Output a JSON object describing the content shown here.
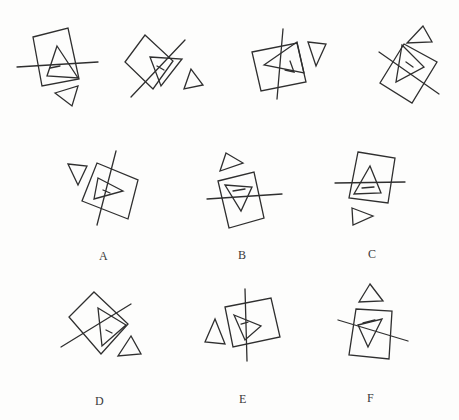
{
  "canvas": {
    "width": 459,
    "height": 420
  },
  "colors": {
    "ink": "#2f2f2f",
    "paper": "#fdfdfc",
    "label_ink": "#3a3a3a"
  },
  "stroke_width": 1.3,
  "figures": [
    {
      "name": "stimulus-1",
      "label": "",
      "shapes": [
        {
          "role": "square",
          "closed": true,
          "points": [
            [
              33,
              37
            ],
            [
              68,
              28
            ],
            [
              79,
              79
            ],
            [
              42,
              86
            ]
          ]
        },
        {
          "role": "large-triangle",
          "closed": true,
          "points": [
            [
              57,
              46
            ],
            [
              78,
              78
            ],
            [
              47,
              76
            ]
          ]
        },
        {
          "role": "triangle-hook",
          "closed": false,
          "points": [
            [
              50,
              68
            ],
            [
              60,
              66
            ]
          ]
        },
        {
          "role": "crossing-line",
          "closed": false,
          "points": [
            [
              17,
              67
            ],
            [
              98,
              62
            ]
          ]
        },
        {
          "role": "small-triangle",
          "closed": true,
          "points": [
            [
              55,
              93
            ],
            [
              78,
              86
            ],
            [
              72,
              106
            ]
          ]
        }
      ]
    },
    {
      "name": "stimulus-2",
      "label": "",
      "shapes": [
        {
          "role": "square",
          "closed": true,
          "points": [
            [
              145,
              35
            ],
            [
              173,
              61
            ],
            [
              153,
              89
            ],
            [
              125,
              62
            ]
          ]
        },
        {
          "role": "large-triangle",
          "closed": true,
          "points": [
            [
              150,
              57
            ],
            [
              182,
              59
            ],
            [
              161,
              86
            ]
          ]
        },
        {
          "role": "triangle-hook",
          "closed": false,
          "points": [
            [
              157,
              66
            ],
            [
              164,
              70
            ]
          ]
        },
        {
          "role": "crossing-line",
          "closed": false,
          "points": [
            [
              185,
              40
            ],
            [
              131,
              97
            ]
          ]
        },
        {
          "role": "small-triangle",
          "closed": true,
          "points": [
            [
              191,
              69
            ],
            [
              184,
              89
            ],
            [
              203,
              85
            ]
          ]
        }
      ]
    },
    {
      "name": "stimulus-3",
      "label": "",
      "shapes": [
        {
          "role": "square",
          "closed": true,
          "points": [
            [
              252,
              52
            ],
            [
              297,
              43
            ],
            [
              306,
              82
            ],
            [
              261,
              91
            ]
          ]
        },
        {
          "role": "large-triangle",
          "closed": true,
          "points": [
            [
              264,
              65
            ],
            [
              297,
              42
            ],
            [
              304,
              73
            ]
          ]
        },
        {
          "role": "triangle-hook",
          "closed": false,
          "points": [
            [
              290,
              61
            ],
            [
              294,
              72
            ],
            [
              285,
              70
            ]
          ]
        },
        {
          "role": "crossing-line",
          "closed": false,
          "points": [
            [
              283,
              29
            ],
            [
              277,
              99
            ]
          ]
        },
        {
          "role": "small-triangle",
          "closed": true,
          "points": [
            [
              308,
              42
            ],
            [
              326,
              44
            ],
            [
              316,
              66
            ]
          ]
        }
      ]
    },
    {
      "name": "stimulus-4",
      "label": "",
      "shapes": [
        {
          "role": "square",
          "closed": true,
          "points": [
            [
              404,
              44
            ],
            [
              437,
              62
            ],
            [
              412,
              103
            ],
            [
              380,
              83
            ]
          ]
        },
        {
          "role": "large-triangle",
          "closed": true,
          "points": [
            [
              402,
              45
            ],
            [
              424,
              67
            ],
            [
              396,
              82
            ]
          ]
        },
        {
          "role": "triangle-hook",
          "closed": false,
          "points": [
            [
              406,
              62
            ],
            [
              413,
              67
            ]
          ]
        },
        {
          "role": "crossing-line",
          "closed": false,
          "points": [
            [
              379,
              52
            ],
            [
              439,
              94
            ]
          ]
        },
        {
          "role": "small-triangle",
          "closed": true,
          "points": [
            [
              423,
              26
            ],
            [
              407,
              43
            ],
            [
              432,
              42
            ]
          ]
        }
      ]
    },
    {
      "name": "option-a",
      "label": "A",
      "shapes": [
        {
          "role": "small-triangle",
          "closed": true,
          "points": [
            [
              68,
              164
            ],
            [
              87,
              166
            ],
            [
              78,
              185
            ]
          ]
        },
        {
          "role": "square",
          "closed": true,
          "points": [
            [
              97,
              163
            ],
            [
              138,
              180
            ],
            [
              128,
              219
            ],
            [
              82,
              201
            ]
          ]
        },
        {
          "role": "large-triangle",
          "closed": true,
          "points": [
            [
              98,
              178
            ],
            [
              123,
              191
            ],
            [
              94,
              199
            ]
          ]
        },
        {
          "role": "triangle-hook",
          "closed": false,
          "points": [
            [
              103,
              190
            ],
            [
              110,
              193
            ]
          ]
        },
        {
          "role": "crossing-line",
          "closed": false,
          "points": [
            [
              116,
              151
            ],
            [
              97,
              225
            ]
          ]
        }
      ]
    },
    {
      "name": "option-b",
      "label": "B",
      "shapes": [
        {
          "role": "small-triangle",
          "closed": true,
          "points": [
            [
              226,
              153
            ],
            [
              243,
              163
            ],
            [
              220,
              171
            ]
          ]
        },
        {
          "role": "square",
          "closed": true,
          "points": [
            [
              218,
              181
            ],
            [
              254,
              172
            ],
            [
              264,
              218
            ],
            [
              229,
              228
            ]
          ]
        },
        {
          "role": "large-triangle",
          "closed": true,
          "points": [
            [
              225,
              185
            ],
            [
              252,
              187
            ],
            [
              241,
              211
            ]
          ]
        },
        {
          "role": "triangle-hook",
          "closed": false,
          "points": [
            [
              233,
              191
            ],
            [
              245,
              189
            ]
          ]
        },
        {
          "role": "crossing-line",
          "closed": false,
          "points": [
            [
              207,
              199
            ],
            [
              282,
              194
            ]
          ]
        }
      ]
    },
    {
      "name": "option-c",
      "label": "C",
      "shapes": [
        {
          "role": "square",
          "closed": true,
          "points": [
            [
              358,
              152
            ],
            [
              395,
              158
            ],
            [
              388,
              203
            ],
            [
              349,
              198
            ]
          ]
        },
        {
          "role": "large-triangle",
          "closed": true,
          "points": [
            [
              370,
              166
            ],
            [
              381,
              193
            ],
            [
              354,
              194
            ]
          ]
        },
        {
          "role": "triangle-hook",
          "closed": false,
          "points": [
            [
              362,
              188
            ],
            [
              374,
              187
            ]
          ]
        },
        {
          "role": "crossing-line",
          "closed": false,
          "points": [
            [
              335,
              183
            ],
            [
              405,
              182
            ]
          ]
        },
        {
          "role": "small-triangle",
          "closed": true,
          "points": [
            [
              352,
              208
            ],
            [
              373,
              216
            ],
            [
              353,
              225
            ]
          ]
        }
      ]
    },
    {
      "name": "option-d",
      "label": "D",
      "shapes": [
        {
          "role": "square",
          "closed": true,
          "points": [
            [
              94,
              292
            ],
            [
              128,
              324
            ],
            [
              101,
              354
            ],
            [
              69,
              317
            ]
          ]
        },
        {
          "role": "large-triangle",
          "closed": true,
          "points": [
            [
              98,
              308
            ],
            [
              126,
              325
            ],
            [
              102,
              346
            ]
          ]
        },
        {
          "role": "triangle-hook",
          "closed": false,
          "points": [
            [
              106,
              330
            ],
            [
              112,
              333
            ]
          ]
        },
        {
          "role": "crossing-line",
          "closed": false,
          "points": [
            [
              61,
              347
            ],
            [
              131,
              304
            ]
          ]
        },
        {
          "role": "small-triangle",
          "closed": true,
          "points": [
            [
              131,
              336
            ],
            [
              118,
              356
            ],
            [
              141,
              354
            ]
          ]
        }
      ]
    },
    {
      "name": "option-e",
      "label": "E",
      "shapes": [
        {
          "role": "small-triangle",
          "closed": true,
          "points": [
            [
              215,
              319
            ],
            [
              205,
              342
            ],
            [
              225,
              344
            ]
          ]
        },
        {
          "role": "square",
          "closed": true,
          "points": [
            [
              225,
              307
            ],
            [
              271,
              298
            ],
            [
              280,
              337
            ],
            [
              233,
              347
            ]
          ]
        },
        {
          "role": "large-triangle",
          "closed": true,
          "points": [
            [
              234,
              315
            ],
            [
              261,
              326
            ],
            [
              245,
              340
            ]
          ]
        },
        {
          "role": "triangle-hook",
          "closed": false,
          "points": [
            [
              241,
              324
            ],
            [
              248,
              322
            ]
          ]
        },
        {
          "role": "crossing-line",
          "closed": false,
          "points": [
            [
              245,
              289
            ],
            [
              247,
              361
            ]
          ]
        }
      ]
    },
    {
      "name": "option-f",
      "label": "F",
      "shapes": [
        {
          "role": "small-triangle",
          "closed": true,
          "points": [
            [
              370,
              284
            ],
            [
              359,
              302
            ],
            [
              383,
              301
            ]
          ]
        },
        {
          "role": "square",
          "closed": true,
          "points": [
            [
              356,
              309
            ],
            [
              392,
              311
            ],
            [
              389,
              359
            ],
            [
              349,
              355
            ]
          ]
        },
        {
          "role": "large-triangle",
          "closed": true,
          "points": [
            [
              358,
              325
            ],
            [
              382,
              319
            ],
            [
              368,
              347
            ]
          ]
        },
        {
          "role": "triangle-hook",
          "closed": false,
          "points": [
            [
              363,
              323
            ],
            [
              375,
              320
            ]
          ]
        },
        {
          "role": "crossing-line",
          "closed": false,
          "points": [
            [
              338,
              320
            ],
            [
              408,
              341
            ]
          ]
        }
      ]
    }
  ]
}
